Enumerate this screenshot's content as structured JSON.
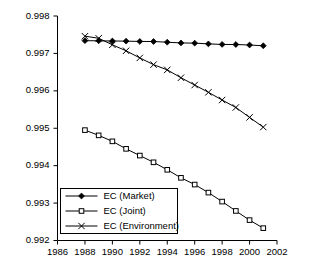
{
  "chart_data": {
    "type": "line",
    "title": "",
    "subtitle": "",
    "xlabel": "",
    "ylabel": "",
    "xlim": [
      1986,
      2002
    ],
    "ylim": [
      0.992,
      0.998
    ],
    "grid": false,
    "legend_position": "bottom-left",
    "x_ticks": [
      "1986",
      "1988",
      "1990",
      "1992",
      "1994",
      "1996",
      "1998",
      "2000",
      "2002"
    ],
    "y_ticks": [
      "0.992",
      "0.993",
      "0.994",
      "0.995",
      "0.996",
      "0.997",
      "0.998"
    ],
    "x": [
      1988,
      1989,
      1990,
      1991,
      1992,
      1993,
      1994,
      1995,
      1996,
      1997,
      1998,
      1999,
      2000,
      2001
    ],
    "series": [
      {
        "name": "EC (Market)",
        "marker": "filled-diamond",
        "values": [
          0.99734,
          0.997337,
          0.997332,
          0.997328,
          0.99732,
          0.997318,
          0.9973,
          0.99728,
          0.997275,
          0.997255,
          0.99724,
          0.997238,
          0.997225,
          0.997205
        ]
      },
      {
        "name": "EC (Joint)",
        "marker": "open-square",
        "values": [
          0.99495,
          0.99481,
          0.99465,
          0.99445,
          0.99427,
          0.99409,
          0.99389,
          0.993675,
          0.993495,
          0.99328,
          0.99304,
          0.99279,
          0.992545,
          0.99233
        ]
      },
      {
        "name": "EC (Environment)",
        "marker": "cross",
        "values": [
          0.99746,
          0.997405,
          0.99723,
          0.99707,
          0.99688,
          0.9967,
          0.99656,
          0.99635,
          0.996155,
          0.99596,
          0.995755,
          0.995555,
          0.99529,
          0.99503
        ]
      }
    ]
  },
  "legend": {
    "entries": [
      {
        "label": "EC (Market)"
      },
      {
        "label": "EC (Joint)"
      },
      {
        "label": "EC (Environment)"
      }
    ]
  },
  "colors": {
    "axis": "#000000",
    "series": "#000000",
    "background": "#ffffff"
  }
}
